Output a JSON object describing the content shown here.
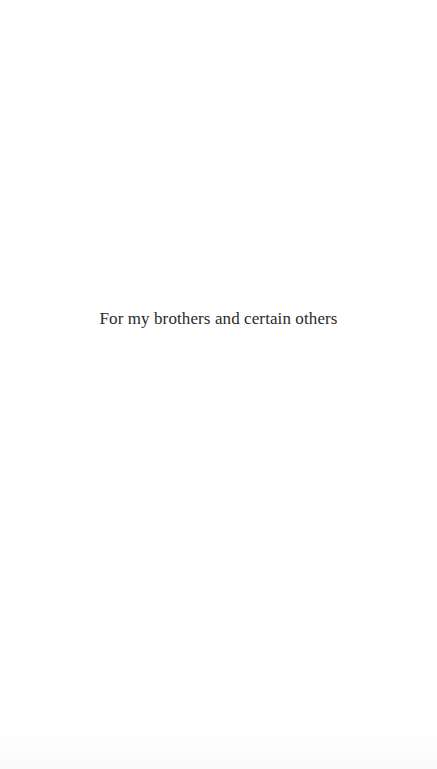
{
  "page": {
    "type": "dedication",
    "text": "For my brothers and certain others"
  }
}
